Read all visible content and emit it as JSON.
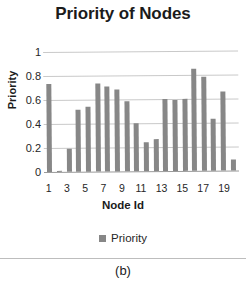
{
  "caption": {
    "label": "(b)"
  },
  "chart_data": {
    "type": "bar",
    "title": "Priority of Nodes",
    "xlabel": "Node Id",
    "ylabel": "Priority",
    "ylim": [
      0,
      1
    ],
    "yticks": [
      "1",
      "0.8",
      "0.6",
      "0.4",
      "0.2",
      "0"
    ],
    "ytick_values": [
      1,
      0.8,
      0.6,
      0.4,
      0.2,
      0
    ],
    "grid": true,
    "legend_position": "bottom",
    "series_color": "#878787",
    "categories": [
      1,
      2,
      3,
      4,
      5,
      6,
      7,
      8,
      9,
      10,
      11,
      12,
      13,
      14,
      15,
      16,
      17,
      18,
      19,
      20
    ],
    "xtick_labels": [
      "1",
      "",
      "3",
      "",
      "5",
      "",
      "7",
      "",
      "9",
      "",
      "11",
      "",
      "13",
      "",
      "15",
      "",
      "17",
      "",
      "19",
      ""
    ],
    "series": [
      {
        "name": "Priority",
        "values": [
          0.73,
          0.01,
          0.19,
          0.52,
          0.54,
          0.73,
          0.71,
          0.68,
          0.58,
          0.4,
          0.24,
          0.27,
          0.6,
          0.59,
          0.6,
          0.85,
          0.78,
          0.43,
          0.66,
          0.09
        ]
      }
    ]
  }
}
